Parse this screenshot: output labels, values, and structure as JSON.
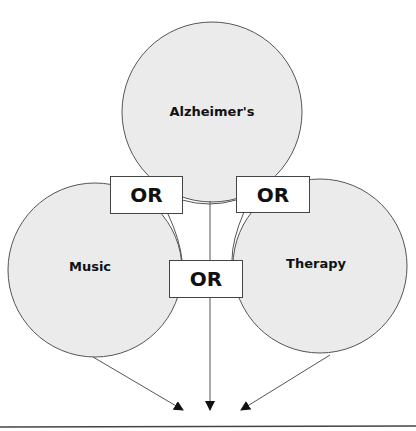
{
  "diagram": {
    "type": "search-concept-diagram",
    "colors": {
      "circle_fill": "#ebebeb",
      "stroke": "#555555",
      "box_fill": "#ffffff",
      "text": "#111111"
    },
    "concepts": [
      {
        "id": "alzheimers",
        "label": "Alzheimer's",
        "cx": 212,
        "cy": 125,
        "r": 90
      },
      {
        "id": "music",
        "label": "Music",
        "cx": 95,
        "cy": 268,
        "r": 85
      },
      {
        "id": "therapy",
        "label": "Therapy",
        "cx": 322,
        "cy": 264,
        "r": 86
      }
    ],
    "operators": [
      {
        "id": "or-left",
        "label": "OR"
      },
      {
        "id": "or-right",
        "label": "OR"
      },
      {
        "id": "or-middle",
        "label": "OR"
      }
    ],
    "arrows": [
      {
        "from": "music",
        "to": "result"
      },
      {
        "from": "alzheimers",
        "to": "result"
      },
      {
        "from": "therapy",
        "to": "result"
      }
    ]
  }
}
